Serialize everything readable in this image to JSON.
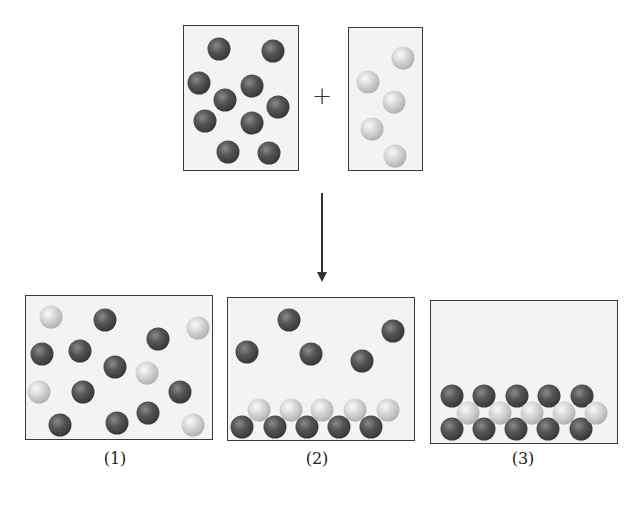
{
  "diagram": {
    "operator": "+",
    "reactants": [
      {
        "name": "reactant-a",
        "box": {
          "x": 183,
          "y": 25,
          "w": 116,
          "h": 146
        },
        "particle_type": "dark",
        "balls": [
          [
            219,
            49
          ],
          [
            273,
            51
          ],
          [
            199,
            83
          ],
          [
            252,
            86
          ],
          [
            225,
            100
          ],
          [
            278,
            107
          ],
          [
            205,
            121
          ],
          [
            252,
            123
          ],
          [
            228,
            152
          ],
          [
            269,
            153
          ]
        ]
      },
      {
        "name": "reactant-b",
        "box": {
          "x": 348,
          "y": 27,
          "w": 75,
          "h": 144
        },
        "particle_type": "light",
        "balls": [
          [
            403,
            58
          ],
          [
            368,
            82
          ],
          [
            394,
            102
          ],
          [
            372,
            129
          ],
          [
            395,
            156
          ]
        ]
      }
    ],
    "plus_position": [
      322,
      96
    ],
    "arrow": {
      "x": 322,
      "y1": 193,
      "y2": 282
    },
    "options": [
      {
        "label": "(1)",
        "label_pos": [
          115,
          458
        ],
        "box": {
          "x": 25,
          "y": 295,
          "w": 188,
          "h": 145
        },
        "dark": [
          [
            105,
            320
          ],
          [
            158,
            339
          ],
          [
            42,
            354
          ],
          [
            80,
            351
          ],
          [
            115,
            367
          ],
          [
            83,
            392
          ],
          [
            180,
            392
          ],
          [
            148,
            413
          ],
          [
            60,
            425
          ],
          [
            117,
            423
          ]
        ],
        "light": [
          [
            51,
            317
          ],
          [
            198,
            328
          ],
          [
            147,
            373
          ],
          [
            39,
            392
          ],
          [
            193,
            425
          ]
        ]
      },
      {
        "label": "(2)",
        "label_pos": [
          317,
          458
        ],
        "box": {
          "x": 227,
          "y": 297,
          "w": 188,
          "h": 144
        },
        "dark": [
          [
            289,
            320
          ],
          [
            393,
            331
          ],
          [
            247,
            352
          ],
          [
            311,
            354
          ],
          [
            362,
            361
          ],
          [
            242,
            427
          ],
          [
            275,
            427
          ],
          [
            307,
            427
          ],
          [
            339,
            427
          ],
          [
            371,
            427
          ]
        ],
        "light": [
          [
            259,
            410
          ],
          [
            291,
            410
          ],
          [
            322,
            410
          ],
          [
            355,
            410
          ],
          [
            388,
            410
          ]
        ]
      },
      {
        "label": "(3)",
        "label_pos": [
          523,
          458
        ],
        "box": {
          "x": 430,
          "y": 300,
          "w": 188,
          "h": 144
        },
        "dark": [
          [
            452,
            396
          ],
          [
            484,
            396
          ],
          [
            517,
            396
          ],
          [
            549,
            396
          ],
          [
            582,
            396
          ],
          [
            452,
            429
          ],
          [
            484,
            429
          ],
          [
            516,
            429
          ],
          [
            548,
            429
          ],
          [
            581,
            429
          ]
        ],
        "light": [
          [
            468,
            413
          ],
          [
            500,
            413
          ],
          [
            532,
            413
          ],
          [
            564,
            413
          ],
          [
            596,
            413
          ]
        ]
      }
    ]
  }
}
